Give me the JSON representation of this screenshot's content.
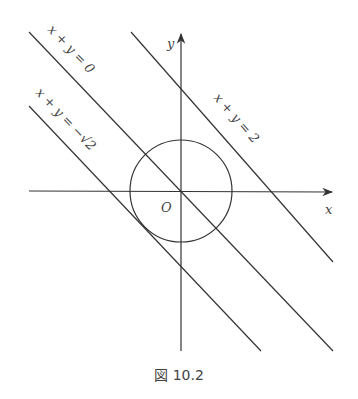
{
  "figure": {
    "caption": "図 10.2",
    "axes": {
      "x_label": "x",
      "y_label": "y",
      "origin_label": "O"
    },
    "circle": {
      "center": [
        0,
        0
      ],
      "radius": 1,
      "label": "x² + y² = 1 (unit circle)"
    },
    "lines": [
      {
        "id": "line-sum-0",
        "equation": "x + y = 0",
        "label_parts": [
          "x",
          "+",
          "y",
          "=",
          "0"
        ]
      },
      {
        "id": "line-sum-neg-sqrt2",
        "equation": "x + y = −√2",
        "label_parts": [
          "x",
          "+",
          "y",
          "=",
          "−",
          "√2"
        ]
      },
      {
        "id": "line-sum-2",
        "equation": "x + y = 2",
        "label_parts": [
          "x",
          "+",
          "y",
          "=",
          "2"
        ]
      }
    ],
    "colors": {
      "stroke": "#333333",
      "text": "#444444",
      "background": "#ffffff"
    }
  }
}
